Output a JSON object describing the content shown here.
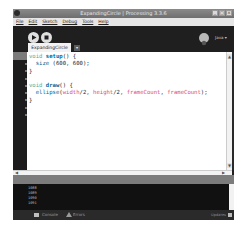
{
  "window": {
    "title": "ExpandingCircle | Processing 3.3.6",
    "controls": [
      "_",
      "□",
      "×"
    ]
  },
  "menubar": {
    "items": [
      "File",
      "Edit",
      "Sketch",
      "Debug",
      "Tools",
      "Help"
    ]
  },
  "toolbar": {
    "run_icon": "play-icon",
    "stop_icon": "stop-icon",
    "debug_icon": "debug-icon",
    "mode_label": "Java ▾"
  },
  "tabs": [
    {
      "label": "ExpandingCircle",
      "active": true
    }
  ],
  "tab_menu_arrow": "▾",
  "editor": {
    "lines": [
      "void setup() {",
      "  size (600, 600);",
      "}",
      "",
      "void draw() {",
      "  ellipse(width/2, height/2, frameCount, frameCount);",
      "}"
    ]
  },
  "console": {
    "lines": [
      "1088",
      "1089",
      "1090",
      "1091"
    ]
  },
  "footer": {
    "console_label": "Console",
    "errors_label": "Errors",
    "updates_label": "Updates"
  },
  "colors": {
    "keyword": "#33997e",
    "function": "#006699",
    "builtin_var": "#d94a7a",
    "toolbar_bg": "#1f1f1f",
    "status_bg": "#7c7c7c"
  }
}
